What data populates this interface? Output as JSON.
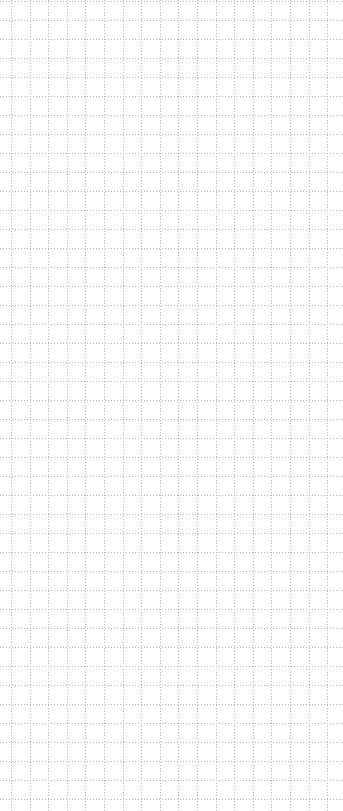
{
  "canvas": {
    "width": 343,
    "height": 811,
    "background": "#ffffff"
  },
  "grid": {
    "style": "dotted",
    "line_color": "#b8b8b8",
    "cell_width": 18.6,
    "cell_height": 19,
    "offset_x": 11,
    "offset_y": 1,
    "dash": [
      1,
      2
    ]
  }
}
